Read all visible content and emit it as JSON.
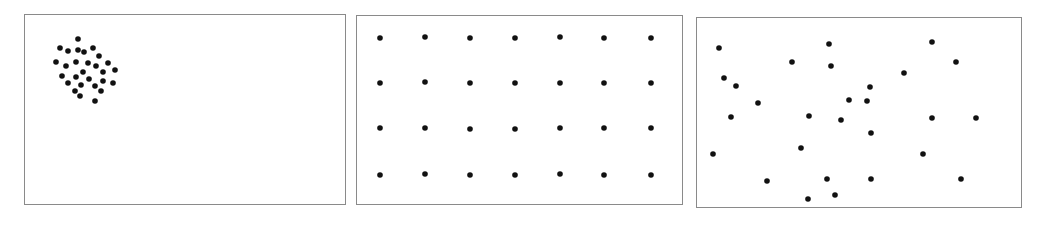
{
  "figure": {
    "width": 1040,
    "height": 229,
    "background": "#ffffff",
    "frame_color": "#8a8a8a",
    "dot_color": "#111111",
    "dot_radius": 2.8
  },
  "chart_data": [
    {
      "type": "scatter",
      "title": "",
      "pattern": "clustered",
      "xlabel": "",
      "ylabel": "",
      "grid": false,
      "legend": null,
      "frame": {
        "left": 24,
        "top": 14,
        "right": 346,
        "bottom": 205
      },
      "points": [
        [
          78,
          39
        ],
        [
          60,
          48
        ],
        [
          68,
          51
        ],
        [
          78,
          50
        ],
        [
          84,
          52
        ],
        [
          93,
          48
        ],
        [
          99,
          56
        ],
        [
          56,
          62
        ],
        [
          66,
          66
        ],
        [
          76,
          62
        ],
        [
          88,
          63
        ],
        [
          96,
          66
        ],
        [
          108,
          63
        ],
        [
          115,
          70
        ],
        [
          103,
          72
        ],
        [
          83,
          72
        ],
        [
          62,
          76
        ],
        [
          76,
          77
        ],
        [
          89,
          79
        ],
        [
          103,
          81
        ],
        [
          113,
          83
        ],
        [
          68,
          83
        ],
        [
          81,
          85
        ],
        [
          95,
          86
        ],
        [
          101,
          91
        ],
        [
          75,
          91
        ],
        [
          80,
          96
        ],
        [
          95,
          101
        ]
      ]
    },
    {
      "type": "scatter",
      "title": "",
      "pattern": "regular",
      "xlabel": "",
      "ylabel": "",
      "grid": false,
      "legend": null,
      "frame": {
        "left": 356,
        "top": 15,
        "right": 683,
        "bottom": 205
      },
      "grid_columns_x": [
        380,
        425,
        470,
        515,
        560,
        604,
        651
      ],
      "grid_rows_y": [
        38,
        83,
        128,
        175
      ],
      "points": [
        [
          380,
          38
        ],
        [
          425,
          37
        ],
        [
          470,
          38
        ],
        [
          515,
          38
        ],
        [
          560,
          37
        ],
        [
          604,
          38
        ],
        [
          651,
          38
        ],
        [
          380,
          83
        ],
        [
          425,
          82
        ],
        [
          470,
          83
        ],
        [
          515,
          83
        ],
        [
          560,
          83
        ],
        [
          604,
          83
        ],
        [
          651,
          83
        ],
        [
          380,
          128
        ],
        [
          425,
          128
        ],
        [
          470,
          129
        ],
        [
          515,
          129
        ],
        [
          560,
          128
        ],
        [
          604,
          128
        ],
        [
          651,
          128
        ],
        [
          380,
          175
        ],
        [
          425,
          174
        ],
        [
          470,
          175
        ],
        [
          515,
          175
        ],
        [
          560,
          174
        ],
        [
          604,
          175
        ],
        [
          651,
          175
        ]
      ]
    },
    {
      "type": "scatter",
      "title": "",
      "pattern": "random",
      "xlabel": "",
      "ylabel": "",
      "grid": false,
      "legend": null,
      "frame": {
        "left": 696,
        "top": 17,
        "right": 1022,
        "bottom": 208
      },
      "points": [
        [
          719,
          48
        ],
        [
          829,
          44
        ],
        [
          932,
          42
        ],
        [
          792,
          62
        ],
        [
          831,
          66
        ],
        [
          956,
          62
        ],
        [
          904,
          73
        ],
        [
          724,
          78
        ],
        [
          736,
          86
        ],
        [
          870,
          87
        ],
        [
          849,
          100
        ],
        [
          867,
          101
        ],
        [
          758,
          103
        ],
        [
          731,
          117
        ],
        [
          809,
          116
        ],
        [
          841,
          120
        ],
        [
          932,
          118
        ],
        [
          976,
          118
        ],
        [
          871,
          133
        ],
        [
          713,
          154
        ],
        [
          801,
          148
        ],
        [
          923,
          154
        ],
        [
          767,
          181
        ],
        [
          827,
          179
        ],
        [
          871,
          179
        ],
        [
          961,
          179
        ],
        [
          835,
          195
        ],
        [
          808,
          199
        ]
      ]
    }
  ]
}
